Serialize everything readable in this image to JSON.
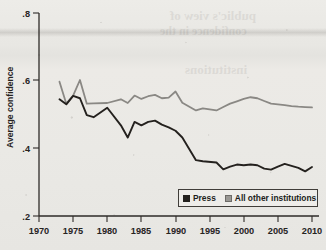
{
  "chart_data": {
    "type": "line",
    "title": "",
    "subtitle": "",
    "xlabel": "",
    "ylabel": "Average confidence",
    "xlim": [
      1970,
      2011
    ],
    "ylim": [
      0.2,
      0.8
    ],
    "xticks": [
      1970,
      1975,
      1980,
      1985,
      1990,
      1995,
      2000,
      2005,
      2010
    ],
    "yticks": [
      0.2,
      0.4,
      0.6,
      0.8
    ],
    "xtick_labels": [
      "1970",
      "1975",
      "1980",
      "1985",
      "1990",
      "1995",
      "2000",
      "2005",
      "2010"
    ],
    "ytick_labels": [
      ".2",
      ".4",
      ".6",
      ".8"
    ],
    "grid": false,
    "legend_position": "lower right",
    "x": [
      1973,
      1974,
      1975,
      1976,
      1977,
      1978,
      1980,
      1982,
      1983,
      1984,
      1985,
      1986,
      1987,
      1988,
      1989,
      1990,
      1991,
      1993,
      1994,
      1996,
      1997,
      1998,
      1999,
      2000,
      2001,
      2002,
      2003,
      2004,
      2005,
      2006,
      2007,
      2008,
      2009,
      2010
    ],
    "series": [
      {
        "name": "Press",
        "color": "#24211e",
        "values": [
          0.545,
          0.53,
          0.555,
          0.548,
          0.498,
          0.492,
          0.52,
          0.468,
          0.432,
          0.478,
          0.468,
          0.478,
          0.482,
          0.47,
          0.462,
          0.452,
          0.432,
          0.365,
          0.362,
          0.358,
          0.338,
          0.346,
          0.352,
          0.35,
          0.352,
          0.35,
          0.34,
          0.337,
          0.346,
          0.354,
          0.348,
          0.342,
          0.332,
          0.345
        ]
      },
      {
        "name": "All other institutions",
        "color": "#8a8884",
        "values": [
          0.597,
          0.532,
          0.556,
          0.602,
          0.532,
          0.533,
          0.534,
          0.545,
          0.534,
          0.556,
          0.546,
          0.554,
          0.558,
          0.548,
          0.55,
          0.568,
          0.535,
          0.512,
          0.518,
          0.512,
          0.522,
          0.532,
          0.539,
          0.546,
          0.551,
          0.548,
          0.54,
          0.532,
          0.53,
          0.528,
          0.525,
          0.523,
          0.522,
          0.521
        ]
      }
    ]
  },
  "axes": {
    "ylabel": "Average confidence",
    "ytick_labels": [
      ".8",
      ".6",
      ".4",
      ".2"
    ],
    "xtick_labels": [
      "1970",
      "1975",
      "1980",
      "1985",
      "1990",
      "1995",
      "2000",
      "2005",
      "2010"
    ]
  },
  "legend": {
    "entries": [
      {
        "label": "Press",
        "swatch": "dark-square-marker"
      },
      {
        "label": "All other institutions",
        "swatch": "gray-square-marker"
      }
    ]
  },
  "colors": {
    "press": "#24211e",
    "other": "#8a8884",
    "axis": "#2e2b28",
    "paper": "#e9e8e4"
  },
  "bleed_through": {
    "lines": [
      "public's view of",
      "confidence in the",
      "institutions"
    ]
  }
}
